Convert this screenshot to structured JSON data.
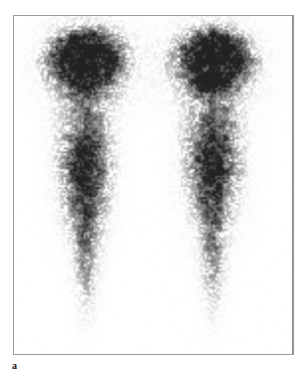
{
  "figure": {
    "panel_letter": "a",
    "modality": "nuclear-medicine-scintigraphy",
    "view": "anterior whole-leg planar scintigram",
    "frame": {
      "border_color": "#9a9a9e",
      "background_color": "#ffffff",
      "x": 13,
      "y": 15,
      "width": 281,
      "height": 340
    },
    "image_colors": {
      "background": "#ffffff",
      "low_uptake": "#d8d8dc",
      "mid_uptake": "#9a9aa0",
      "high_uptake": "#4c4c52",
      "hotspot_core": "#3a3a40"
    }
  },
  "chart_data": {
    "type": "heatmap",
    "title": "",
    "subtitle": "",
    "xlabel": "",
    "ylabel": "",
    "grid": false,
    "legend": "none",
    "colormap": "grayscale-inverted",
    "value_label": "radiotracer uptake (counts)",
    "value_range": [
      0,
      100
    ],
    "xlim": [
      0,
      281
    ],
    "ylim": [
      0,
      340
    ],
    "annotations": [
      "a"
    ],
    "regions": [
      {
        "name": "left-limb-proximal-hotspot",
        "cx": 70,
        "cy": 42,
        "rx": 26,
        "ry": 25,
        "intensity": 100,
        "description": "focal intense uptake, proximal left limb"
      },
      {
        "name": "right-limb-proximal-hotspot",
        "cx": 203,
        "cy": 42,
        "rx": 25,
        "ry": 24,
        "intensity": 100,
        "description": "focal intense uptake, proximal right limb"
      },
      {
        "name": "left-limb-proximal-halo",
        "cx": 76,
        "cy": 48,
        "rx": 42,
        "ry": 40,
        "intensity": 38,
        "description": "diffuse halo around left proximal focus"
      },
      {
        "name": "right-limb-proximal-halo",
        "cx": 199,
        "cy": 48,
        "rx": 42,
        "ry": 40,
        "intensity": 38,
        "description": "diffuse halo around right proximal focus"
      },
      {
        "name": "left-limb-mid-shaft",
        "cx": 70,
        "cy": 150,
        "rx": 24,
        "ry": 62,
        "intensity": 56,
        "description": "moderate heterogeneous uptake, left mid shaft"
      },
      {
        "name": "right-limb-mid-shaft",
        "cx": 200,
        "cy": 145,
        "rx": 26,
        "ry": 62,
        "intensity": 58,
        "description": "moderate heterogeneous uptake, right mid shaft"
      },
      {
        "name": "left-limb-distal-shaft",
        "cx": 72,
        "cy": 235,
        "rx": 13,
        "ry": 55,
        "intensity": 26,
        "description": "faint tapering distal uptake, left limb"
      },
      {
        "name": "right-limb-distal-shaft",
        "cx": 200,
        "cy": 235,
        "rx": 13,
        "ry": 55,
        "intensity": 26,
        "description": "faint tapering distal uptake, right limb"
      }
    ],
    "limbs": [
      {
        "name": "left-limb",
        "axis_x": 72,
        "top_y": 12,
        "bottom_y": 305,
        "width_profile": [
          {
            "y": 14,
            "half_width": 30
          },
          {
            "y": 45,
            "half_width": 42
          },
          {
            "y": 80,
            "half_width": 30
          },
          {
            "y": 115,
            "half_width": 26
          },
          {
            "y": 155,
            "half_width": 26
          },
          {
            "y": 195,
            "half_width": 20
          },
          {
            "y": 235,
            "half_width": 14
          },
          {
            "y": 275,
            "half_width": 10
          },
          {
            "y": 305,
            "half_width": 7
          }
        ],
        "intensity_profile": [
          {
            "y": 14,
            "value": 55
          },
          {
            "y": 35,
            "value": 96
          },
          {
            "y": 50,
            "value": 100
          },
          {
            "y": 68,
            "value": 66
          },
          {
            "y": 88,
            "value": 30
          },
          {
            "y": 110,
            "value": 34
          },
          {
            "y": 135,
            "value": 55
          },
          {
            "y": 160,
            "value": 58
          },
          {
            "y": 185,
            "value": 52
          },
          {
            "y": 210,
            "value": 38
          },
          {
            "y": 240,
            "value": 26
          },
          {
            "y": 270,
            "value": 17
          },
          {
            "y": 300,
            "value": 9
          }
        ]
      },
      {
        "name": "right-limb",
        "axis_x": 200,
        "top_y": 12,
        "bottom_y": 305,
        "width_profile": [
          {
            "y": 14,
            "half_width": 30
          },
          {
            "y": 45,
            "half_width": 42
          },
          {
            "y": 80,
            "half_width": 30
          },
          {
            "y": 115,
            "half_width": 28
          },
          {
            "y": 155,
            "half_width": 26
          },
          {
            "y": 195,
            "half_width": 19
          },
          {
            "y": 235,
            "half_width": 13
          },
          {
            "y": 275,
            "half_width": 10
          },
          {
            "y": 305,
            "half_width": 7
          }
        ],
        "intensity_profile": [
          {
            "y": 14,
            "value": 55
          },
          {
            "y": 35,
            "value": 97
          },
          {
            "y": 50,
            "value": 100
          },
          {
            "y": 68,
            "value": 64
          },
          {
            "y": 88,
            "value": 30
          },
          {
            "y": 110,
            "value": 42
          },
          {
            "y": 135,
            "value": 60
          },
          {
            "y": 160,
            "value": 56
          },
          {
            "y": 185,
            "value": 46
          },
          {
            "y": 210,
            "value": 34
          },
          {
            "y": 240,
            "value": 24
          },
          {
            "y": 270,
            "value": 16
          },
          {
            "y": 300,
            "value": 8
          }
        ]
      }
    ],
    "noise": {
      "type": "poisson-speckle",
      "grain_px": 2,
      "amplitude": 0.55
    }
  }
}
